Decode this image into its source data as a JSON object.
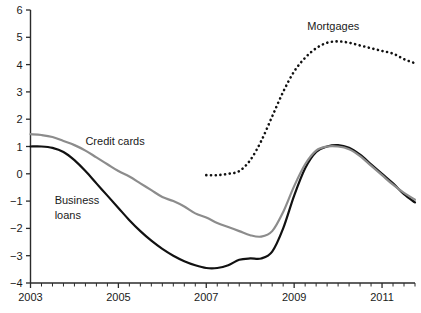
{
  "chart_data": {
    "type": "line",
    "title": "",
    "subtitle": "",
    "xlabel": "",
    "ylabel": "",
    "xlim": [
      2003.0,
      2011.75
    ],
    "ylim": [
      -4,
      6
    ],
    "grid": false,
    "legend": "inline-labels",
    "y_ticks": [
      "6",
      "5",
      "4",
      "3",
      "2",
      "1",
      "0",
      "-1",
      "-2",
      "-3",
      "-4"
    ],
    "y_tick_values": [
      6,
      5,
      4,
      3,
      2,
      1,
      0,
      -1,
      -2,
      -3,
      -4
    ],
    "x_ticks": [
      "2003",
      "2005",
      "2007",
      "2009",
      "2011"
    ],
    "x_tick_values": [
      2003,
      2005,
      2007,
      2009,
      2011
    ],
    "x_minor_step": 0.25,
    "series": [
      {
        "name": "Business loans",
        "label": "Business loans",
        "label_line1": "Business",
        "label_line2": "loans",
        "color": "#111111",
        "style": "solid",
        "x": [
          2003.0,
          2003.25,
          2003.5,
          2003.75,
          2004.0,
          2004.25,
          2004.5,
          2004.75,
          2005.0,
          2005.25,
          2005.5,
          2005.75,
          2006.0,
          2006.25,
          2006.5,
          2006.75,
          2007.0,
          2007.25,
          2007.5,
          2007.75,
          2008.0,
          2008.25,
          2008.5,
          2008.75,
          2009.0,
          2009.25,
          2009.5,
          2009.75,
          2010.0,
          2010.25,
          2010.5,
          2010.75,
          2011.0,
          2011.25,
          2011.5,
          2011.75
        ],
        "y": [
          1.0,
          1.0,
          0.95,
          0.8,
          0.5,
          0.1,
          -0.35,
          -0.8,
          -1.25,
          -1.7,
          -2.1,
          -2.45,
          -2.75,
          -3.0,
          -3.2,
          -3.35,
          -3.45,
          -3.45,
          -3.35,
          -3.15,
          -3.1,
          -3.1,
          -2.85,
          -2.0,
          -0.8,
          0.2,
          0.8,
          1.0,
          1.05,
          0.95,
          0.7,
          0.35,
          0.0,
          -0.35,
          -0.75,
          -1.05
        ]
      },
      {
        "name": "Credit cards",
        "label": "Credit cards",
        "color": "#8c8c8c",
        "style": "solid",
        "x": [
          2003.0,
          2003.25,
          2003.5,
          2003.75,
          2004.0,
          2004.25,
          2004.5,
          2004.75,
          2005.0,
          2005.25,
          2005.5,
          2005.75,
          2006.0,
          2006.25,
          2006.5,
          2006.75,
          2007.0,
          2007.25,
          2007.5,
          2007.75,
          2008.0,
          2008.25,
          2008.5,
          2008.75,
          2009.0,
          2009.25,
          2009.5,
          2009.75,
          2010.0,
          2010.25,
          2010.5,
          2010.75,
          2011.0,
          2011.25,
          2011.5,
          2011.75
        ],
        "y": [
          1.45,
          1.42,
          1.35,
          1.2,
          1.05,
          0.85,
          0.6,
          0.35,
          0.1,
          -0.1,
          -0.35,
          -0.6,
          -0.85,
          -1.0,
          -1.2,
          -1.45,
          -1.6,
          -1.8,
          -1.95,
          -2.1,
          -2.25,
          -2.3,
          -2.1,
          -1.4,
          -0.45,
          0.35,
          0.85,
          1.0,
          1.0,
          0.9,
          0.65,
          0.3,
          -0.05,
          -0.4,
          -0.7,
          -0.95
        ]
      },
      {
        "name": "Mortgages",
        "label": "Mortgages",
        "color": "#111111",
        "style": "dotted",
        "x": [
          2007.0,
          2007.25,
          2007.5,
          2007.75,
          2008.0,
          2008.25,
          2008.5,
          2008.75,
          2009.0,
          2009.25,
          2009.5,
          2009.75,
          2010.0,
          2010.25,
          2010.5,
          2010.75,
          2011.0,
          2011.25,
          2011.5,
          2011.75
        ],
        "y": [
          -0.05,
          -0.05,
          0.0,
          0.1,
          0.5,
          1.2,
          2.1,
          3.0,
          3.75,
          4.25,
          4.6,
          4.8,
          4.85,
          4.8,
          4.7,
          4.6,
          4.5,
          4.4,
          4.2,
          4.05
        ]
      }
    ],
    "annotations": [
      {
        "text": "Mortgages",
        "x": 2009.3,
        "y": 5.25
      },
      {
        "text": "Credit cards",
        "x": 2004.25,
        "y": 1.05
      },
      {
        "text": "Business",
        "x": 2003.55,
        "y": -1.1
      },
      {
        "text": "loans",
        "x": 2003.55,
        "y": -1.65
      }
    ]
  }
}
